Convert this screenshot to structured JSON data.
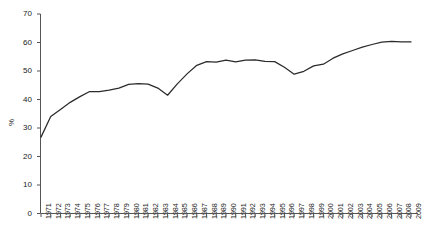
{
  "chart_data": {
    "type": "line",
    "title": "",
    "xlabel": "",
    "ylabel": "%",
    "ylim": [
      0,
      70
    ],
    "ytick_step": 10,
    "yticks": [
      0,
      10,
      20,
      30,
      40,
      50,
      60,
      70
    ],
    "grid": false,
    "legend": "none",
    "line_color": "#2b2b2b",
    "categories": [
      "1971",
      "1972",
      "1973",
      "1974",
      "1975",
      "1976",
      "1977",
      "1978",
      "1979",
      "1980",
      "1981",
      "1982",
      "1983",
      "1984",
      "1985",
      "1986",
      "1987",
      "1988",
      "1989",
      "1990",
      "1991",
      "1992",
      "1993",
      "1994",
      "1995",
      "1996",
      "1997",
      "1998",
      "1999",
      "2000",
      "2001",
      "2002",
      "2003",
      "2004",
      "2005",
      "2006",
      "2007",
      "2008",
      "2009"
    ],
    "values": [
      26.8,
      34.0,
      36.5,
      39.0,
      41.0,
      42.8,
      42.8,
      43.3,
      44.0,
      45.3,
      45.6,
      45.4,
      44.0,
      41.5,
      45.5,
      49.0,
      52.0,
      53.3,
      53.1,
      53.8,
      53.2,
      53.8,
      53.9,
      53.4,
      53.3,
      51.3,
      48.9,
      49.9,
      51.8,
      52.4,
      54.5,
      56.0,
      57.2,
      58.4,
      59.3,
      60.1,
      60.4,
      60.2,
      60.2
    ]
  },
  "axis": {
    "y_label": "%",
    "y_tick_labels": [
      "70",
      "60",
      "50",
      "40",
      "30",
      "20",
      "10",
      "0"
    ],
    "x_tick_labels": [
      "1971",
      "1972",
      "1973",
      "1974",
      "1975",
      "1976",
      "1977",
      "1978",
      "1979",
      "1980",
      "1981",
      "1982",
      "1983",
      "1984",
      "1985",
      "1986",
      "1987",
      "1988",
      "1989",
      "1990",
      "1991",
      "1992",
      "1993",
      "1994",
      "1995",
      "1996",
      "1997",
      "1998",
      "1999",
      "2000",
      "2001",
      "2002",
      "2003",
      "2004",
      "2005",
      "2006",
      "2007",
      "2008",
      "2009"
    ]
  }
}
